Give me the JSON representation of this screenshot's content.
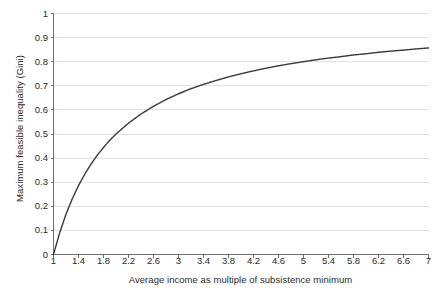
{
  "chart_data": {
    "type": "line",
    "title": "",
    "subtitle": "",
    "xlabel": "Average income as multiple of subsistence minimum",
    "ylabel": "Maximum feasible inequality (Gini)",
    "xlim": [
      1,
      7
    ],
    "ylim": [
      0,
      1
    ],
    "grid": "horizontal-only",
    "legend": "none",
    "xticks": [
      "1",
      "1.4",
      "1.8",
      "2.2",
      "2.6",
      "3",
      "3.4",
      "3.8",
      "4.2",
      "4.6",
      "5",
      "5.4",
      "5.8",
      "6.2",
      "6.6",
      "7"
    ],
    "xtick_values": [
      1,
      1.4,
      1.8,
      2.2,
      2.6,
      3,
      3.4,
      3.8,
      4.2,
      4.6,
      5,
      5.4,
      5.8,
      6.2,
      6.6,
      7
    ],
    "yticks": [
      "0",
      "0.1",
      "0.2",
      "0.3",
      "0.4",
      "0.5",
      "0.6",
      "0.7",
      "0.8",
      "0.9",
      "1"
    ],
    "ytick_values": [
      0,
      0.1,
      0.2,
      0.3,
      0.4,
      0.5,
      0.6,
      0.7,
      0.8,
      0.9,
      1
    ],
    "series": [
      {
        "name": "Inequality possibility frontier",
        "color": "#3a3a3a",
        "linewidth": 1.4,
        "x": [
          1,
          1.1,
          1.2,
          1.3,
          1.4,
          1.5,
          1.6,
          1.7,
          1.8,
          1.9,
          2,
          2.2,
          2.4,
          2.6,
          2.8,
          3,
          3.2,
          3.4,
          3.6,
          3.8,
          4,
          4.2,
          4.4,
          4.6,
          4.8,
          5,
          5.2,
          5.4,
          5.6,
          5.8,
          6,
          6.2,
          6.4,
          6.6,
          6.8,
          7
        ],
        "values": [
          0,
          0.091,
          0.167,
          0.231,
          0.286,
          0.333,
          0.375,
          0.412,
          0.444,
          0.474,
          0.5,
          0.545,
          0.583,
          0.615,
          0.643,
          0.667,
          0.688,
          0.706,
          0.722,
          0.737,
          0.75,
          0.762,
          0.773,
          0.783,
          0.792,
          0.8,
          0.808,
          0.815,
          0.821,
          0.828,
          0.833,
          0.839,
          0.844,
          0.848,
          0.853,
          0.857
        ]
      }
    ],
    "grid_color": "#e3e3e3",
    "axis_color": "#6f6f6f",
    "background": "#ffffff"
  }
}
